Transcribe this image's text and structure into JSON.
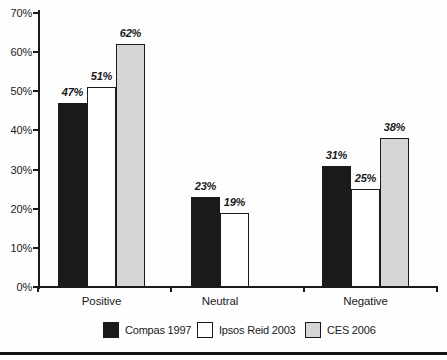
{
  "chart_data": {
    "type": "bar",
    "title": "",
    "xlabel": "",
    "ylabel": "",
    "categories": [
      "Positive",
      "Neutral",
      "Negative"
    ],
    "series": [
      {
        "name": "Compas 1997",
        "color": "#1a1a1a",
        "values": [
          47,
          23,
          31
        ]
      },
      {
        "name": "Ipsos Reid 2003",
        "color": "#ffffff",
        "values": [
          51,
          19,
          25
        ]
      },
      {
        "name": "CES 2006",
        "color": "#d6d6d6",
        "values": [
          62,
          null,
          38
        ]
      }
    ],
    "value_label_suffix": "%",
    "ylim": [
      0,
      70
    ],
    "ytick_step": 10,
    "ytick_labels": [
      "0%",
      "10%",
      "20%",
      "30%",
      "40%",
      "50%",
      "60%",
      "70%"
    ],
    "grid": false,
    "legend_position": "bottom"
  }
}
